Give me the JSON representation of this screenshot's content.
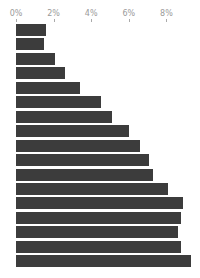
{
  "chart_data": {
    "type": "bar",
    "orientation": "horizontal",
    "title": "",
    "xlabel": "",
    "ylabel": "",
    "xlim": [
      0,
      9.5
    ],
    "x_ticks": [
      "0%",
      "2%",
      "4%",
      "6%",
      "8%"
    ],
    "x_tick_values": [
      0,
      2,
      4,
      6,
      8
    ],
    "axis_position": "top",
    "grid": false,
    "legend": null,
    "categories": [
      "",
      "",
      "",
      "",
      "",
      "",
      "",
      "",
      "",
      "",
      "",
      "",
      "",
      "",
      "",
      "",
      ""
    ],
    "values": [
      1.6,
      1.5,
      2.1,
      2.6,
      3.4,
      4.5,
      5.1,
      6.0,
      6.6,
      7.1,
      7.3,
      8.1,
      8.9,
      8.8,
      8.6,
      8.8,
      9.3
    ],
    "bar_color": "#3c3c3c"
  }
}
